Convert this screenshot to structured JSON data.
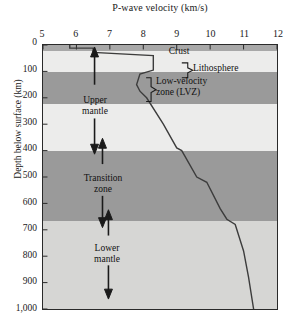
{
  "chart_data": {
    "type": "line",
    "title": "P-wave velocity (km/s)",
    "xlabel": "P-wave velocity (km/s)",
    "ylabel": "Depth below surface (km)",
    "xlim": [
      5,
      12
    ],
    "ylim": [
      0,
      1000
    ],
    "x_ticks": [
      "5",
      "6",
      "7",
      "8",
      "9",
      "10",
      "11",
      "12"
    ],
    "x_tick_values": [
      5,
      6,
      7,
      8,
      9,
      10,
      11,
      12
    ],
    "y_ticks": [
      "0",
      "100",
      "200",
      "300",
      "400",
      "500",
      "600",
      "700",
      "800",
      "900",
      "1,000"
    ],
    "y_tick_values": [
      0,
      100,
      200,
      300,
      400,
      500,
      600,
      700,
      800,
      900,
      1000
    ],
    "y_axis_inverted": true,
    "grid": false,
    "legend": "none",
    "series": [
      {
        "name": "P-wave velocity",
        "points": [
          [
            5.8,
            0
          ],
          [
            5.8,
            12
          ],
          [
            6.5,
            12
          ],
          [
            6.5,
            28
          ],
          [
            8.3,
            40
          ],
          [
            8.3,
            95
          ],
          [
            7.9,
            110
          ],
          [
            7.8,
            150
          ],
          [
            7.9,
            175
          ],
          [
            8.1,
            200
          ],
          [
            8.6,
            300
          ],
          [
            9.0,
            390
          ],
          [
            9.15,
            400
          ],
          [
            9.6,
            500
          ],
          [
            9.9,
            520
          ],
          [
            10.3,
            620
          ],
          [
            10.5,
            660
          ],
          [
            10.75,
            680
          ],
          [
            11.0,
            780
          ],
          [
            11.15,
            880
          ],
          [
            11.3,
            1000
          ]
        ]
      }
    ],
    "bands": [
      {
        "name": "crust-strip",
        "top_km": 0,
        "bottom_km": 22,
        "shade": "#a8a8a8"
      },
      {
        "name": "lithosphere",
        "top_km": 22,
        "bottom_km": 100,
        "shade": "#ececeb"
      },
      {
        "name": "low-velocity-zone",
        "top_km": 100,
        "bottom_km": 220,
        "shade": "#9a9a9a"
      },
      {
        "name": "upper-mantle-lower",
        "top_km": 220,
        "bottom_km": 400,
        "shade": "#ececeb"
      },
      {
        "name": "transition-zone",
        "top_km": 400,
        "bottom_km": 660,
        "shade": "#9a9a9a"
      },
      {
        "name": "lower-mantle",
        "top_km": 660,
        "bottom_km": 1000,
        "shade": "#d6d6d4"
      }
    ],
    "annotations": [
      {
        "name": "crust",
        "label": "Crust"
      },
      {
        "name": "lithosphere",
        "label": "Lithosphere"
      },
      {
        "name": "low-velocity-zone",
        "label": "Low-velocity\nzone (LVZ)"
      },
      {
        "name": "upper-mantle",
        "label": "Upper\nmantle"
      },
      {
        "name": "transition-zone",
        "label": "Transition\nzone"
      },
      {
        "name": "lower-mantle",
        "label": "Lower\nmantle"
      }
    ]
  },
  "chart": {
    "title": "P-wave velocity (km/s)",
    "y_axis_title": "Depth below surface (km)"
  },
  "labels": {
    "crust": "Crust",
    "lithosphere": "Lithosphere",
    "lvz": "Low-velocity\nzone (LVZ)",
    "upper_mantle": "Upper\nmantle",
    "transition_zone": "Transition\nzone",
    "lower_mantle": "Lower\nmantle"
  },
  "colors": {
    "curve": "#3c3c3c",
    "axis": "#2a2a2a",
    "band_dark": "#9a9a9a",
    "band_light": "#ececeb",
    "band_lower": "#d6d6d4",
    "band_crust": "#a8a8a8"
  }
}
